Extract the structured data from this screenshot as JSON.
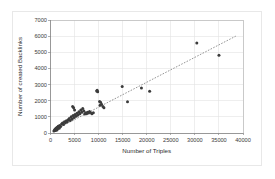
{
  "chart_data": {
    "type": "scatter",
    "title": "",
    "xlabel": "Number of Triples",
    "ylabel": "Number of created Backlinks",
    "xlim": [
      0,
      40000
    ],
    "ylim": [
      0,
      7000
    ],
    "xticks": [
      0,
      5000,
      10000,
      15000,
      20000,
      25000,
      30000,
      35000,
      40000
    ],
    "yticks": [
      0,
      1000,
      2000,
      3000,
      4000,
      5000,
      6000,
      7000
    ],
    "xtick_labels": [
      "0",
      "5000",
      "10000",
      "15000",
      "20000",
      "25000",
      "30000",
      "35000",
      "40000"
    ],
    "ytick_labels": [
      "0",
      "1000",
      "2000",
      "3000",
      "4000",
      "5000",
      "6000",
      "7000"
    ],
    "grid": true,
    "legend": "none",
    "marker_color": "#3b3b3b",
    "marker_shape": "circle",
    "trendline": {
      "style": "dotted",
      "color": "#7a7a7a",
      "x_start": 600,
      "y_start": 150,
      "x_end": 38500,
      "y_end": 6000
    },
    "points": [
      [
        700,
        120
      ],
      [
        850,
        170
      ],
      [
        900,
        210
      ],
      [
        1000,
        150
      ],
      [
        1050,
        260
      ],
      [
        1100,
        190
      ],
      [
        1200,
        310
      ],
      [
        1250,
        230
      ],
      [
        1350,
        180
      ],
      [
        1400,
        350
      ],
      [
        1500,
        280
      ],
      [
        1600,
        420
      ],
      [
        1700,
        360
      ],
      [
        1800,
        300
      ],
      [
        1900,
        470
      ],
      [
        2100,
        400
      ],
      [
        2300,
        560
      ],
      [
        2500,
        620
      ],
      [
        2700,
        520
      ],
      [
        2900,
        700
      ],
      [
        3100,
        640
      ],
      [
        3300,
        760
      ],
      [
        3500,
        700
      ],
      [
        3700,
        820
      ],
      [
        3900,
        900
      ],
      [
        4100,
        780
      ],
      [
        4300,
        1010
      ],
      [
        4500,
        870
      ],
      [
        4700,
        1080
      ],
      [
        4900,
        960
      ],
      [
        5100,
        1150
      ],
      [
        5300,
        1040
      ],
      [
        5500,
        1230
      ],
      [
        5700,
        1120
      ],
      [
        5900,
        1310
      ],
      [
        6100,
        1200
      ],
      [
        6300,
        1420
      ],
      [
        6500,
        1290
      ],
      [
        6700,
        1510
      ],
      [
        6900,
        1380
      ],
      [
        4600,
        1640
      ],
      [
        4800,
        1560
      ],
      [
        5000,
        1420
      ],
      [
        7100,
        1180
      ],
      [
        7300,
        1260
      ],
      [
        7500,
        1200
      ],
      [
        7700,
        1290
      ],
      [
        7900,
        1240
      ],
      [
        8100,
        1330
      ],
      [
        8300,
        1270
      ],
      [
        8600,
        1200
      ],
      [
        8900,
        1260
      ],
      [
        9600,
        2600
      ],
      [
        9700,
        2650
      ],
      [
        9800,
        2560
      ],
      [
        10200,
        1950
      ],
      [
        10400,
        1900
      ],
      [
        10600,
        1780
      ],
      [
        10900,
        1640
      ],
      [
        11100,
        1560
      ],
      [
        10300,
        1720
      ],
      [
        14900,
        2880
      ],
      [
        16000,
        1940
      ],
      [
        18900,
        2780
      ],
      [
        20600,
        2590
      ],
      [
        30400,
        5580
      ],
      [
        35000,
        4820
      ]
    ]
  },
  "axes": {
    "x_axis_name": "x-axis",
    "y_axis_name": "y-axis"
  }
}
